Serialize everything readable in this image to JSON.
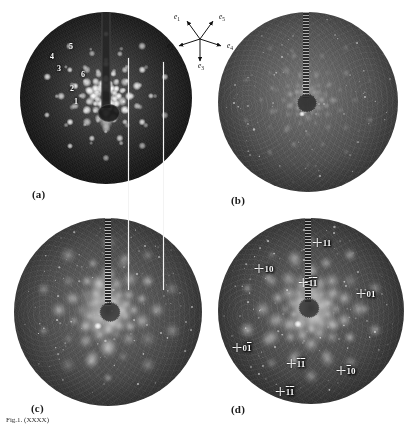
{
  "figure": {
    "caption": "Fig.1. (XXXX)",
    "panels": [
      {
        "id": "a",
        "tag": "(a)"
      },
      {
        "id": "b",
        "tag": "(b)"
      },
      {
        "id": "c",
        "tag": "(c)"
      },
      {
        "id": "d",
        "tag": "(d)"
      }
    ]
  },
  "panel_a": {
    "tag": "(a)",
    "spot_labels": [
      {
        "text": "1",
        "x": 74,
        "y": 101
      },
      {
        "text": "2",
        "x": 70,
        "y": 88
      },
      {
        "text": "3",
        "x": 57,
        "y": 68
      },
      {
        "text": "4",
        "x": 50,
        "y": 56
      },
      {
        "text": "5",
        "x": 69,
        "y": 46
      },
      {
        "text": "6",
        "x": 81,
        "y": 74
      }
    ]
  },
  "panel_b": {
    "tag": "(b)"
  },
  "panel_c": {
    "tag": "(c)"
  },
  "panel_d": {
    "tag": "(d)",
    "index_labels": [
      {
        "id": "d-11-top",
        "digits": "11",
        "bars": [
          false,
          false
        ],
        "x": 322,
        "y": 243
      },
      {
        "id": "d-10-upperleft",
        "digits": "10",
        "bars": [
          false,
          false
        ],
        "x": 264,
        "y": 269
      },
      {
        "id": "d-1b1b-center",
        "digits": "11",
        "bars": [
          true,
          true
        ],
        "x": 308,
        "y": 283
      },
      {
        "id": "d-01-right",
        "digits": "01",
        "bars": [
          false,
          false
        ],
        "x": 366,
        "y": 294
      },
      {
        "id": "d-01b-left",
        "digits": "01",
        "bars": [
          false,
          true
        ],
        "x": 242,
        "y": 348
      },
      {
        "id": "d-1b1-lower",
        "digits": "11",
        "bars": [
          true,
          true
        ],
        "x": 296,
        "y": 364
      },
      {
        "id": "d-1b0-right",
        "digits": "10",
        "bars": [
          true,
          false
        ],
        "x": 346,
        "y": 371
      },
      {
        "id": "d-1b1b-bottom",
        "digits": "11",
        "bars": [
          true,
          true
        ],
        "x": 285,
        "y": 392
      }
    ]
  },
  "vector_star": {
    "vectors": [
      {
        "name": "e1",
        "label": "e",
        "sub": "1",
        "angle_deg": 234,
        "lx": 14,
        "ly": 11
      },
      {
        "name": "e5",
        "label": "e",
        "sub": "5",
        "angle_deg": 306,
        "lx": 59,
        "ly": 11
      },
      {
        "name": "e2",
        "label": "e",
        "sub": "2",
        "angle_deg": 162,
        "lx": 7,
        "ly": 40
      },
      {
        "name": "e4",
        "label": "e",
        "sub": "4",
        "angle_deg": 18,
        "lx": 67,
        "ly": 40
      },
      {
        "name": "e3",
        "label": "e",
        "sub": "3",
        "angle_deg": 90,
        "lx": 38,
        "ly": 60
      }
    ]
  },
  "chart_data": {
    "type": "scatter",
    "panels": [
      {
        "label": "(a)",
        "kind": "sharp-spot diffraction pattern",
        "numbered_spots": [
          "1",
          "2",
          "3",
          "4",
          "5",
          "6"
        ]
      },
      {
        "label": "(b)",
        "kind": "weak diffuse pattern"
      },
      {
        "label": "(c)",
        "kind": "diffuse blob pattern"
      },
      {
        "label": "(d)",
        "kind": "indexed diffuse pattern",
        "indices": [
          "11",
          "10",
          "1̅1̅",
          "01",
          "01̅",
          "1̅1̅",
          "1̅0",
          "1̅1̅"
        ]
      }
    ],
    "basis_vectors": [
      "e1",
      "e2",
      "e3",
      "e4",
      "e5"
    ]
  }
}
